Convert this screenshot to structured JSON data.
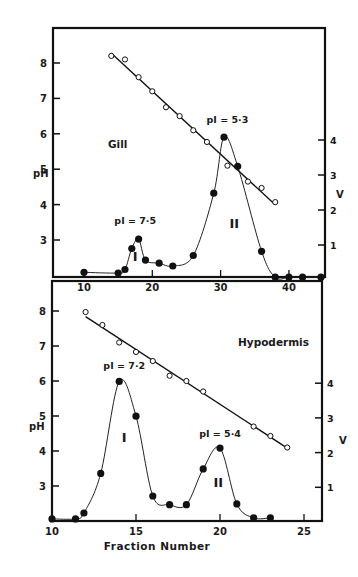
{
  "chart_data": [
    {
      "type": "line",
      "panel": "top",
      "title": "Gill",
      "xlabel": "",
      "ylabel": "pH",
      "y2label": "V",
      "xlim": [
        5.5,
        45.3
      ],
      "ylim": [
        1.96,
        9.0
      ],
      "y2lim": [
        0,
        7.6
      ],
      "x_ticks": [
        10,
        20,
        30,
        40
      ],
      "y_ticks": [
        3,
        4,
        5,
        6,
        7,
        8
      ],
      "y2_ticks": [
        1,
        2,
        3,
        4
      ],
      "grid": false,
      "series": [
        {
          "name": "pH",
          "axis": "left",
          "marker": "open-circle",
          "fit": "linear",
          "x": [
            14,
            16,
            18,
            20,
            22,
            24,
            26,
            28,
            31,
            34,
            36,
            38
          ],
          "values": [
            8.2,
            8.1,
            7.6,
            7.2,
            6.75,
            6.5,
            6.1,
            5.77,
            5.1,
            4.65,
            4.47,
            4.07
          ]
        },
        {
          "name": "V",
          "axis": "right",
          "marker": "filled-circle",
          "fit": "smooth",
          "x": [
            10,
            15,
            16,
            17,
            18,
            19,
            21,
            23,
            26,
            29,
            30.5,
            32.5,
            36,
            38,
            40,
            42,
            44.7
          ],
          "values": [
            0.22,
            0.2,
            0.3,
            0.9,
            1.17,
            0.57,
            0.48,
            0.4,
            0.7,
            2.48,
            4.08,
            3.25,
            0.82,
            0.08,
            0.08,
            0.08,
            0.08
          ]
        }
      ],
      "annotations": [
        {
          "text": "pI = 7·5",
          "x": 17.5,
          "y_v": 1.6
        },
        {
          "text": "pI = 5·3",
          "x": 31,
          "y_v": 4.5
        },
        {
          "text": "I",
          "x": 17.5,
          "y_v": 0.55
        },
        {
          "text": "II",
          "x": 32,
          "y_v": 1.5
        }
      ]
    },
    {
      "type": "line",
      "panel": "bottom",
      "title": "Hypodermis",
      "xlabel": "Fraction Number",
      "ylabel": "pH",
      "y2label": "V",
      "xlim": [
        10,
        26
      ],
      "ylim": [
        2.0,
        8.3
      ],
      "y2lim": [
        0,
        6.3
      ],
      "x_ticks": [
        10,
        15,
        20,
        25
      ],
      "y_ticks": [
        3,
        4,
        5,
        6,
        7,
        8
      ],
      "y2_ticks": [
        1,
        2,
        3,
        4
      ],
      "grid": false,
      "series": [
        {
          "name": "pH",
          "axis": "left",
          "marker": "open-circle",
          "fit": "linear",
          "x": [
            12,
            13,
            14,
            15,
            16,
            17,
            18,
            19,
            22,
            23,
            24
          ],
          "values": [
            7.97,
            7.6,
            7.1,
            6.83,
            6.57,
            6.15,
            6.0,
            5.7,
            4.7,
            4.43,
            4.1
          ]
        },
        {
          "name": "V",
          "axis": "right",
          "marker": "filled-circle",
          "fit": "smooth",
          "x": [
            10,
            11.4,
            11.9,
            12.9,
            14,
            15,
            16,
            17,
            18,
            19,
            20,
            21,
            22,
            23
          ],
          "values": [
            0.09,
            0.09,
            0.26,
            1.4,
            4.05,
            3.05,
            0.75,
            0.5,
            0.5,
            1.53,
            2.13,
            0.52,
            0.12,
            0.12
          ]
        }
      ],
      "annotations": [
        {
          "text": "pI = 7·2",
          "x": 14.3,
          "y_v": 4.4
        },
        {
          "text": "pI = 5·4",
          "x": 20,
          "y_v": 2.45
        },
        {
          "text": "I",
          "x": 14.3,
          "y_v": 2.3
        },
        {
          "text": "II",
          "x": 19.9,
          "y_v": 1.0
        }
      ]
    }
  ],
  "labels": {
    "top_title": "Gill",
    "bottom_title": "Hypodermis",
    "ylabel": "pH",
    "y2label": "V",
    "xlabel": "Fraction Number",
    "top_peak1": "pI = 7·5",
    "top_peak2": "pI = 5·3",
    "bottom_peak1": "pI = 7·2",
    "bottom_peak2": "pI = 5·4",
    "roman1": "I",
    "roman2": "II"
  }
}
